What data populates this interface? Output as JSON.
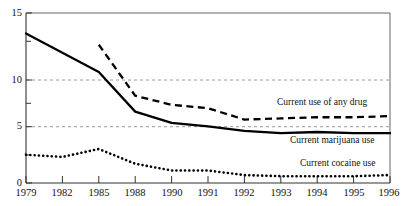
{
  "chart_data": {
    "type": "line",
    "title": "",
    "xlabel": "",
    "ylabel": "",
    "categories": [
      "1979",
      "1982",
      "1985",
      "1988",
      "1990",
      "1991",
      "1992",
      "1993",
      "1994",
      "1995",
      "1996"
    ],
    "ylim": [
      0,
      15
    ],
    "xlim_note": "evenly spaced category axis",
    "yticks_major": [
      0,
      5,
      10,
      15
    ],
    "yticks_minor": [
      2.5,
      7.5,
      12.5
    ],
    "gridlines": {
      "y": [
        5,
        10
      ],
      "style": "dashed",
      "color": "#9a9a9a",
      "x": "none"
    },
    "legend": {
      "position": "inline-right-of-series"
    },
    "series": [
      {
        "name": "Current use of any drug",
        "style": "dashed",
        "color": "#000000",
        "x": [
          "1985",
          "1988",
          "1990",
          "1991",
          "1992",
          "1993",
          "1994",
          "1995",
          "1996"
        ],
        "values": [
          12.2,
          7.7,
          6.9,
          6.6,
          5.6,
          5.7,
          5.8,
          5.8,
          5.9
        ]
      },
      {
        "name": "Current marijuana use",
        "style": "solid",
        "color": "#000000",
        "x": [
          "1979",
          "1982",
          "1985",
          "1988",
          "1990",
          "1991",
          "1992",
          "1993",
          "1994",
          "1995",
          "1996"
        ],
        "values": [
          13.2,
          11.5,
          9.8,
          6.3,
          5.3,
          5.0,
          4.6,
          4.4,
          4.5,
          4.4,
          4.4
        ]
      },
      {
        "name": "Current cocaine use",
        "style": "dotted",
        "color": "#000000",
        "x": [
          "1979",
          "1982",
          "1985",
          "1988",
          "1990",
          "1991",
          "1992",
          "1993",
          "1994",
          "1995",
          "1996"
        ],
        "values": [
          2.5,
          2.3,
          3.0,
          1.7,
          1.1,
          1.1,
          0.7,
          0.6,
          0.6,
          0.6,
          0.7
        ]
      }
    ]
  },
  "axes": {
    "y_tick_labels": [
      "15",
      "10",
      "5",
      "0"
    ],
    "x_tick_labels": [
      "1979",
      "1982",
      "1985",
      "1988",
      "1990",
      "1991",
      "1992",
      "1993",
      "1994",
      "1995",
      "1996"
    ]
  },
  "series_labels": {
    "any_drug": "Current use of any drug",
    "marijuana": "Current marijuana use",
    "cocaine": "Current cocaine use"
  },
  "cropped_header": {
    "ghost_text": ""
  }
}
